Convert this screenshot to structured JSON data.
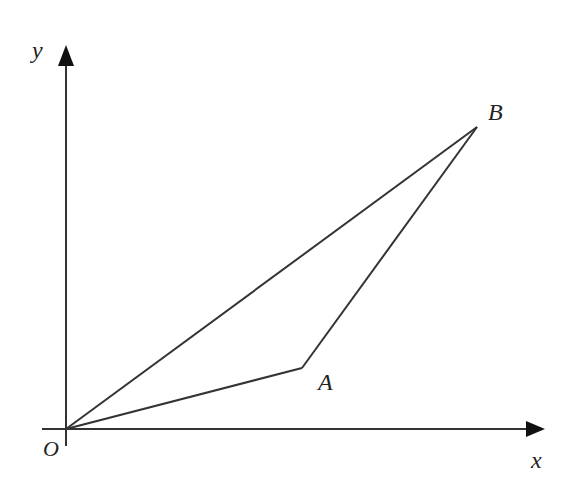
{
  "diagram": {
    "type": "coordinate-geometry",
    "axes": {
      "x_label": "x",
      "y_label": "y",
      "origin_label": "O"
    },
    "points": [
      {
        "id": "O",
        "label": "O",
        "px": [
          66,
          429
        ]
      },
      {
        "id": "A",
        "label": "A",
        "px": [
          302,
          368
        ]
      },
      {
        "id": "B",
        "label": "B",
        "px": [
          477,
          127
        ]
      }
    ],
    "segments": [
      [
        "O",
        "A"
      ],
      [
        "A",
        "B"
      ],
      [
        "O",
        "B"
      ]
    ],
    "colors": {
      "stroke": "#333333",
      "background": "#ffffff"
    }
  }
}
